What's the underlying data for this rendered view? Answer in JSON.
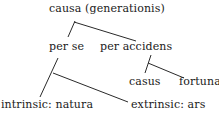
{
  "diagram": {
    "type": "tree",
    "nodes": {
      "root": {
        "label": "causa (generationis)"
      },
      "per_se": {
        "label": "per se"
      },
      "per_accidens": {
        "label": "per accidens"
      },
      "casus": {
        "label": "casus"
      },
      "fortuna": {
        "label": "fortuna"
      },
      "intrinsic": {
        "label": "intrinsic: natura"
      },
      "extrinsic": {
        "label": "extrinsic: ars"
      }
    },
    "edges": [
      {
        "from": "root",
        "to": "per_se"
      },
      {
        "from": "root",
        "to": "per_accidens"
      },
      {
        "from": "per_accidens",
        "to": "casus"
      },
      {
        "from": "per_accidens",
        "to": "fortuna"
      },
      {
        "from": "per_se",
        "to": "intrinsic"
      },
      {
        "from": "per_se",
        "to": "extrinsic"
      }
    ],
    "colors": {
      "text": "#1a1a1a",
      "line": "#2a2a2a",
      "background": "#ffffff"
    }
  }
}
